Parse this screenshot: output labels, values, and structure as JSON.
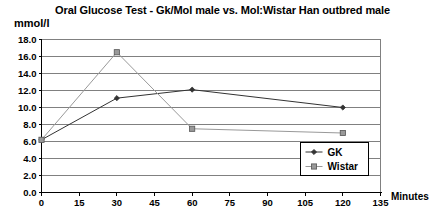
{
  "chart_data": {
    "type": "line",
    "title": "Oral Glucose Test - Gk/Mol male vs. Mol:Wistar Han outbred male",
    "xlabel": "Minutes",
    "ylabel": "mmol/l",
    "xlim": [
      0,
      135
    ],
    "ylim": [
      0,
      18
    ],
    "grid": true,
    "grid_axis": "y",
    "legend_position": "inside-bottom-right",
    "x_ticks": [
      0,
      15,
      30,
      45,
      60,
      75,
      90,
      105,
      120,
      135
    ],
    "x_tick_labels": [
      "0",
      "15",
      "30",
      "45",
      "60",
      "75",
      "90",
      "105",
      "120",
      "135"
    ],
    "y_ticks": [
      0,
      2,
      4,
      6,
      8,
      10,
      12,
      14,
      16,
      18
    ],
    "y_tick_labels": [
      "0.0",
      "2.0",
      "4.0",
      "6.0",
      "8.0",
      "10.0",
      "12.0",
      "14.0",
      "16.0",
      "18.0"
    ],
    "x": [
      0,
      30,
      60,
      120
    ],
    "series": [
      {
        "name": "GK",
        "values": [
          6.2,
          11.1,
          12.1,
          10.0
        ],
        "color": "#333333",
        "marker": "diamond"
      },
      {
        "name": "Wistar",
        "values": [
          6.2,
          16.5,
          7.5,
          7.0
        ],
        "color": "#999999",
        "marker": "square"
      }
    ]
  },
  "legend": {
    "items": [
      {
        "label": "GK"
      },
      {
        "label": "Wistar"
      }
    ]
  },
  "colors": {
    "background": "#ffffff",
    "axis": "#000000",
    "gridline": "#808080",
    "gk_line": "#333333",
    "wistar_line": "#999999"
  }
}
